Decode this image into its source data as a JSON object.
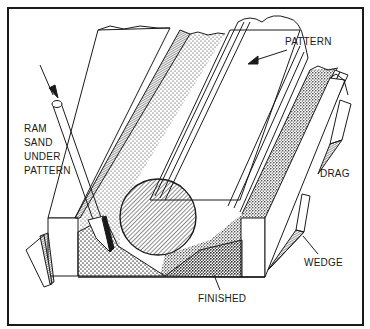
{
  "figure": {
    "colors": {
      "ink": "#1a1a1a",
      "paper": "#ffffff"
    }
  },
  "labels": {
    "pattern": "PATTERN",
    "ram_line1": "RAM",
    "ram_line2": "SAND",
    "ram_line3": "UNDER",
    "ram_line4": "PATTERN",
    "drag": "DRAG",
    "wedge": "WEDGE",
    "finished": "FINISHED"
  }
}
